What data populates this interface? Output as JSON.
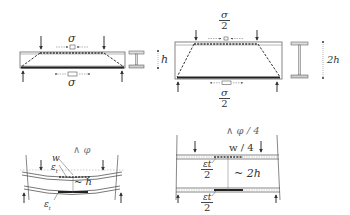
{
  "diagram": {
    "top_left": {
      "label_top": "σ",
      "label_bottom": "σ",
      "dimension": "h"
    },
    "top_right": {
      "label_top_num": "σ",
      "label_top_den": "2",
      "label_bottom_num": "σ",
      "label_bottom_den": "2",
      "dimension": "2h"
    },
    "bottom_left": {
      "rotation": "φ",
      "deflection": "w",
      "strain_top": "ε",
      "strain_top_sub": "t",
      "strain_bottom": "ε",
      "strain_bottom_sub": "t",
      "depth": "~ h"
    },
    "bottom_right": {
      "rotation": "φ / 4",
      "deflection": "w / 4",
      "strain_top_num": "εt",
      "strain_top_den": "2",
      "strain_bottom_num": "εt",
      "strain_bottom_den": "2",
      "depth": "~ 2h"
    },
    "colors": {
      "line": "#555555",
      "fill_light": "#f2f2f2",
      "tie": "#222222"
    }
  }
}
